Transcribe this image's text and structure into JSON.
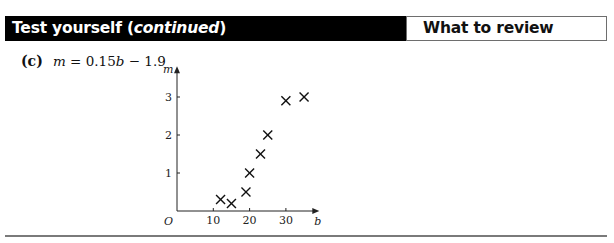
{
  "header": {
    "title_prefix": "Test yourself (",
    "title_italic": "continued",
    "title_suffix": ")",
    "review_label": "What to review"
  },
  "question": {
    "part_label": "(c)",
    "equation_var": "m",
    "equation_rest": " = 0.15",
    "equation_var2": "b",
    "equation_tail": " − 1.9"
  },
  "chart_data": {
    "type": "scatter",
    "title": "",
    "xlabel": "b",
    "ylabel": "m",
    "origin_label": "O",
    "x_ticks": [
      10,
      20,
      30
    ],
    "y_ticks": [
      1,
      2,
      3
    ],
    "xlim": [
      0,
      37
    ],
    "ylim": [
      0,
      3.6
    ],
    "grid": false,
    "marker": "x",
    "points": [
      {
        "b": 12,
        "m": 0.3
      },
      {
        "b": 15,
        "m": 0.2
      },
      {
        "b": 19,
        "m": 0.5
      },
      {
        "b": 20,
        "m": 1.0
      },
      {
        "b": 23,
        "m": 1.5
      },
      {
        "b": 25,
        "m": 2.0
      },
      {
        "b": 30,
        "m": 2.9
      },
      {
        "b": 35,
        "m": 3.0
      }
    ]
  },
  "colors": {
    "header_bg": "#000000",
    "header_text": "#ffffff",
    "rule": "#7a7a7a",
    "ink": "#111111"
  }
}
